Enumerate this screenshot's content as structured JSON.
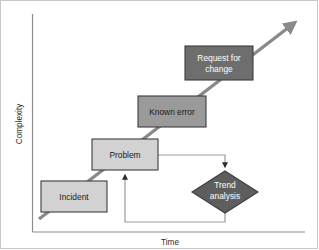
{
  "diagram": {
    "axes": {
      "x_label": "Time",
      "y_label": "Complexity"
    },
    "colors": {
      "light_box_fill": "#d2d2d2",
      "mid_box_fill": "#9a9a9a",
      "dark_box_fill": "#6e6e6e",
      "diamond_fill": "#5e5e5e",
      "box_stroke": "#3d3d3d",
      "axis_stroke": "#8c8c8c",
      "connector_stroke": "#9a9a9a",
      "trend_arrow_stroke": "#8a8a8a",
      "frame_stroke": "#c8c8c8"
    },
    "nodes": [
      {
        "id": "incident",
        "label": "Incident",
        "shape": "rectangle",
        "fill_tone": "light",
        "x": 41,
        "y": 181,
        "width": 66,
        "height": 31
      },
      {
        "id": "problem",
        "label": "Problem",
        "shape": "rectangle",
        "fill_tone": "light",
        "x": 92,
        "y": 139,
        "width": 66,
        "height": 31
      },
      {
        "id": "known-error",
        "label": "Known error",
        "shape": "rectangle",
        "fill_tone": "mid",
        "x": 138,
        "y": 96,
        "width": 68,
        "height": 31
      },
      {
        "id": "request-for-change",
        "label_line1": "Request for",
        "label_line2": "change",
        "shape": "rectangle",
        "fill_tone": "dark",
        "x": 185,
        "y": 46,
        "width": 68,
        "height": 34
      },
      {
        "id": "trend-analysis",
        "label_line1": "Trend",
        "label_line2": "analysis",
        "shape": "diamond",
        "fill_tone": "dark",
        "cx": 225,
        "cy": 192,
        "rx": 33,
        "ry": 21
      }
    ],
    "connectors": [
      {
        "id": "growth-arrow",
        "from": "incident-bottom-left",
        "to": "upper-right",
        "style": "thick-diagonal-arrow",
        "arrowhead": true
      },
      {
        "id": "problem-to-trend",
        "from": "problem",
        "to": "trend-analysis",
        "style": "orthogonal",
        "arrowhead": true
      },
      {
        "id": "trend-to-problem",
        "from": "trend-analysis",
        "to": "problem",
        "style": "orthogonal",
        "arrowhead": true
      }
    ]
  }
}
